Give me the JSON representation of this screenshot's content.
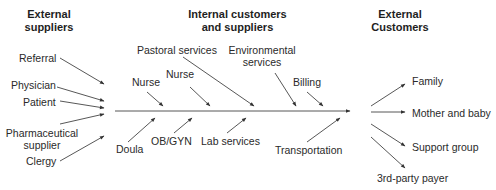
{
  "headers": {
    "left": [
      "External",
      "suppliers"
    ],
    "center": [
      "Internal customers",
      "and suppliers"
    ],
    "right": [
      "External",
      "Customers"
    ]
  },
  "external_suppliers": [
    "Referral",
    "Physician",
    "Patient",
    "Pharmaceutical",
    "supplier",
    "Clergy"
  ],
  "internal_top": [
    "Pastoral services",
    "Environmental",
    "services",
    "Nurse",
    "Nurse",
    "Billing"
  ],
  "internal_bottom": [
    "Doula",
    "OB/GYN",
    "Lab services",
    "Transportation"
  ],
  "external_customers": [
    "Family",
    "Mother and baby",
    "Support group",
    "3rd-party payer"
  ],
  "colors": {
    "line": "#333333",
    "text": "#2a2a2a"
  }
}
